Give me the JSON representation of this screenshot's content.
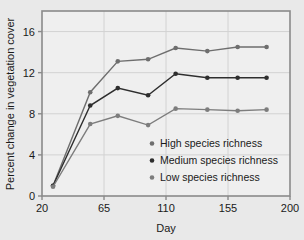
{
  "chart_data": {
    "type": "line",
    "title": "",
    "xlabel": "Day",
    "ylabel": "Percent change in vegetation cover",
    "xlim": [
      20,
      200
    ],
    "ylim": [
      0,
      18
    ],
    "xticks": [
      20,
      65,
      110,
      155,
      200
    ],
    "yticks": [
      0,
      4,
      8,
      12,
      16
    ],
    "grid": true,
    "legend_position": "inside-lower-right",
    "x": [
      28,
      55,
      75,
      97,
      117,
      140,
      162,
      183
    ],
    "series": [
      {
        "name": "High species richness",
        "color": "#6e6e6e",
        "values": [
          1.0,
          10.1,
          13.1,
          13.3,
          14.4,
          14.1,
          14.5,
          14.5
        ]
      },
      {
        "name": "Medium species richness",
        "color": "#2e2e2e",
        "values": [
          1.0,
          8.8,
          10.5,
          9.8,
          11.9,
          11.5,
          11.5,
          11.5
        ]
      },
      {
        "name": "Low species richness",
        "color": "#7d7d7d",
        "values": [
          0.9,
          7.0,
          7.8,
          6.9,
          8.5,
          8.4,
          8.3,
          8.4
        ]
      }
    ]
  },
  "axes": {
    "x_tick_labels": [
      "20",
      "65",
      "110",
      "155",
      "200"
    ],
    "y_tick_labels": [
      "0",
      "4",
      "8",
      "12",
      "16"
    ],
    "x_axis_title": "Day",
    "y_axis_title": "Percent change in vegetation cover"
  },
  "legend": {
    "entries": [
      {
        "label": "High species richness",
        "marker_color": "#6e6e6e"
      },
      {
        "label": "Medium species richness",
        "marker_color": "#2e2e2e"
      },
      {
        "label": "Low species richness",
        "marker_color": "#7d7d7d"
      }
    ]
  },
  "style": {
    "figure_background": "#e9e9e9",
    "plot_background": "#efefef",
    "frame_color": "#8a8a8a",
    "grid_color": "#d2d2d2",
    "text_color": "#1a1a1a"
  }
}
